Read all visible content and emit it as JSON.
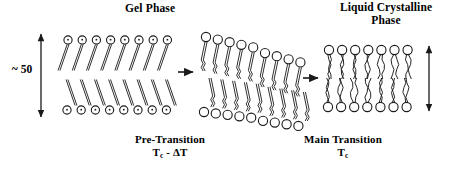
{
  "figure": {
    "background_color": "#ffffff",
    "stroke_color": "#1a1a1a",
    "width": 463,
    "height": 173
  },
  "titles": {
    "gel_phase": "Gel Phase",
    "liquid_crystalline_line1": "Liquid Crystalline",
    "liquid_crystalline_line2": "Phase"
  },
  "transition_labels": {
    "pre_transition_name": "Pre-Transition",
    "pre_transition_temp_base": "T",
    "pre_transition_temp_sub": "c",
    "pre_transition_temp_rest": " - ΔT",
    "main_transition_name": "Main Transition",
    "main_transition_temp_base": "T",
    "main_transition_temp_sub": "c"
  },
  "measurements": {
    "bilayer_thickness_label": "~ 50",
    "left_arrow_top_y": 33,
    "left_arrow_bottom_y": 118,
    "right_arrow_top_y": 45,
    "right_arrow_bottom_y": 112
  },
  "phases": [
    {
      "id": "gel",
      "name": "Gel Phase",
      "head_style": "filled-dot-circle",
      "tail_style": "straight-tilted",
      "lipids_per_leaflet": 8,
      "tilt_degrees": 18
    },
    {
      "id": "ripple",
      "name": "Pre-Transition (Ripple)",
      "head_style": "open-circle",
      "tail_style": "kinked",
      "lipids_per_leaflet": 9,
      "tilt_degrees": 14
    },
    {
      "id": "liquid-crystalline",
      "name": "Liquid Crystalline Phase",
      "head_style": "open-circle",
      "tail_style": "disordered-wavy",
      "lipids_per_leaflet": 7,
      "tilt_degrees": 0
    }
  ],
  "arrows": {
    "transition_1": "arrow-right-icon",
    "transition_2": "arrow-right-icon",
    "thickness_left": "double-headed-vertical-arrow-icon",
    "thickness_right": "double-headed-vertical-arrow-icon"
  }
}
